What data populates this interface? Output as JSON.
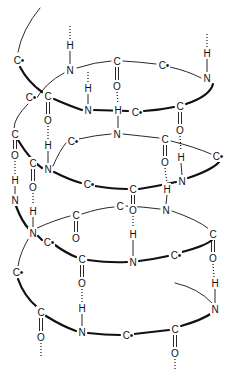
{
  "diagram": {
    "title": "",
    "type": "alpha-helix-hydrogen-bonding",
    "colors": {
      "ink": "#111111",
      "background": "#ffffff"
    },
    "atoms": [
      {
        "id": "a1",
        "label": "C•",
        "x": 18,
        "y": 60
      },
      {
        "id": "a2",
        "label": "H",
        "x": 70,
        "y": 45
      },
      {
        "id": "a3",
        "label": "N",
        "x": 70,
        "y": 70
      },
      {
        "id": "a4",
        "label": "C",
        "x": 117,
        "y": 61
      },
      {
        "id": "a5",
        "label": "O",
        "x": 117,
        "y": 86
      },
      {
        "id": "a6",
        "label": "C•",
        "x": 163,
        "y": 65
      },
      {
        "id": "a7",
        "label": "H",
        "x": 207,
        "y": 53
      },
      {
        "id": "a8",
        "label": "N",
        "x": 207,
        "y": 78
      },
      {
        "id": "a9",
        "label": "C•",
        "x": 30,
        "y": 97
      },
      {
        "id": "a10",
        "label": "C",
        "x": 48,
        "y": 96
      },
      {
        "id": "a11",
        "label": "O",
        "x": 48,
        "y": 120
      },
      {
        "id": "a12",
        "label": "H",
        "x": 88,
        "y": 88
      },
      {
        "id": "a13",
        "label": "N",
        "x": 88,
        "y": 110
      },
      {
        "id": "a14",
        "label": "H",
        "x": 118,
        "y": 110
      },
      {
        "id": "a15",
        "label": "C•",
        "x": 136,
        "y": 112
      },
      {
        "id": "a16",
        "label": "C",
        "x": 180,
        "y": 106
      },
      {
        "id": "a17",
        "label": "O",
        "x": 180,
        "y": 130
      },
      {
        "id": "a18",
        "label": "C",
        "x": 15,
        "y": 134
      },
      {
        "id": "a19",
        "label": "N",
        "x": 117,
        "y": 134
      },
      {
        "id": "a20",
        "label": "C•",
        "x": 72,
        "y": 141
      },
      {
        "id": "a21",
        "label": "C",
        "x": 165,
        "y": 139
      },
      {
        "id": "a22",
        "label": "O",
        "x": 165,
        "y": 162
      },
      {
        "id": "a23",
        "label": "C•",
        "x": 217,
        "y": 156
      },
      {
        "id": "a24",
        "label": "H",
        "x": 48,
        "y": 145
      },
      {
        "id": "a25",
        "label": "O",
        "x": 15,
        "y": 155
      },
      {
        "id": "a26",
        "label": "C",
        "x": 33,
        "y": 163
      },
      {
        "id": "a27",
        "label": "N",
        "x": 48,
        "y": 169
      },
      {
        "id": "a28",
        "label": "H",
        "x": 181,
        "y": 157
      },
      {
        "id": "a29",
        "label": "H",
        "x": 15,
        "y": 180
      },
      {
        "id": "a30",
        "label": "O",
        "x": 33,
        "y": 187
      },
      {
        "id": "a31",
        "label": "C•",
        "x": 88,
        "y": 184
      },
      {
        "id": "a32",
        "label": "C",
        "x": 133,
        "y": 189
      },
      {
        "id": "a33",
        "label": "N",
        "x": 182,
        "y": 181
      },
      {
        "id": "a34",
        "label": "H",
        "x": 167,
        "y": 189
      },
      {
        "id": "a35",
        "label": "N",
        "x": 15,
        "y": 200
      },
      {
        "id": "a36",
        "label": "C",
        "x": 120,
        "y": 206
      },
      {
        "id": "a37",
        "label": "O",
        "x": 133,
        "y": 210
      },
      {
        "id": "a38",
        "label": "N",
        "x": 166,
        "y": 210
      },
      {
        "id": "a39",
        "label": "H",
        "x": 33,
        "y": 211
      },
      {
        "id": "a40",
        "label": "C",
        "x": 76,
        "y": 215
      },
      {
        "id": "a41",
        "label": "O",
        "x": 76,
        "y": 238
      },
      {
        "id": "a42",
        "label": "N",
        "x": 33,
        "y": 233
      },
      {
        "id": "a43",
        "label": "C•",
        "x": 48,
        "y": 242
      },
      {
        "id": "a44",
        "label": "H",
        "x": 133,
        "y": 234
      },
      {
        "id": "a45",
        "label": "C",
        "x": 213,
        "y": 234
      },
      {
        "id": "a46",
        "label": "O",
        "x": 213,
        "y": 258
      },
      {
        "id": "a47",
        "label": "C•",
        "x": 17,
        "y": 272
      },
      {
        "id": "a48",
        "label": "C",
        "x": 82,
        "y": 259
      },
      {
        "id": "a49",
        "label": "N",
        "x": 133,
        "y": 262
      },
      {
        "id": "a50",
        "label": "C•",
        "x": 175,
        "y": 255
      },
      {
        "id": "a51",
        "label": "O",
        "x": 82,
        "y": 283
      },
      {
        "id": "a52",
        "label": "H",
        "x": 82,
        "y": 308
      },
      {
        "id": "a53",
        "label": "H",
        "x": 215,
        "y": 283
      },
      {
        "id": "a54",
        "label": "C",
        "x": 41,
        "y": 312
      },
      {
        "id": "a55",
        "label": "N",
        "x": 215,
        "y": 309
      },
      {
        "id": "a56",
        "label": "O",
        "x": 41,
        "y": 337
      },
      {
        "id": "a57",
        "label": "N",
        "x": 82,
        "y": 332
      },
      {
        "id": "a58",
        "label": "C•",
        "x": 127,
        "y": 335
      },
      {
        "id": "a59",
        "label": "C",
        "x": 175,
        "y": 329
      },
      {
        "id": "a60",
        "label": "O",
        "x": 175,
        "y": 353
      }
    ]
  }
}
